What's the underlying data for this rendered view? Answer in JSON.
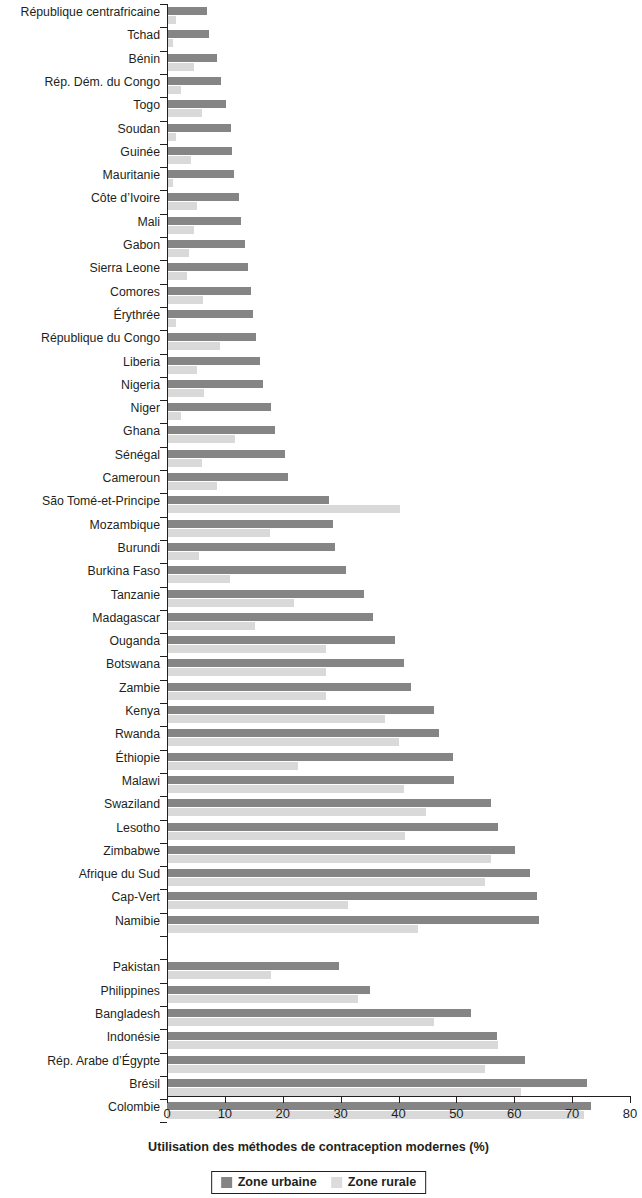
{
  "chart_data": {
    "type": "bar",
    "orientation": "horizontal",
    "title": "",
    "xlabel": "Utilisation des méthodes de contraception modernes (%)",
    "ylabel": "",
    "xlim": [
      0,
      80
    ],
    "xticks": [
      0,
      10,
      20,
      30,
      40,
      50,
      60,
      70,
      80
    ],
    "grid": false,
    "legend_position": "bottom",
    "legend": [
      "Zone urbaine",
      "Zone rurale"
    ],
    "colors": {
      "urban": "#858585",
      "rural": "#d9d9d9",
      "axis": "#231f20",
      "background": "#ffffff"
    },
    "categories": [
      "République centrafricaine",
      "Tchad",
      "Bénin",
      "Rép. Dém. du Congo",
      "Togo",
      "Soudan",
      "Guinée",
      "Mauritanie",
      "Côte d’Ivoire",
      "Mali",
      "Gabon",
      "Sierra Leone",
      "Comores",
      "Érythrée",
      "République du Congo",
      "Liberia",
      "Nigeria",
      "Niger",
      "Ghana",
      "Sénégal",
      "Cameroun",
      "São Tomé-et-Principe",
      "Mozambique",
      "Burundi",
      "Burkina Faso",
      "Tanzanie",
      "Madagascar",
      "Ouganda",
      "Botswana",
      "Zambie",
      "Kenya",
      "Rwanda",
      "Éthiopie",
      "Malawi",
      "Swaziland",
      "Lesotho",
      "Zimbabwe",
      "Afrique du Sud",
      "Cap-Vert",
      "Namibie",
      "Pakistan",
      "Philippines",
      "Bangladesh",
      "Indonésie",
      "Rép. Arabe d’Égypte",
      "Brésil",
      "Colombie"
    ],
    "group_break_after": "Namibie",
    "series": [
      {
        "name": "Zone urbaine",
        "values": [
          6.9,
          7.3,
          8.6,
          9.4,
          10.2,
          11.0,
          11.2,
          11.6,
          12.4,
          12.8,
          13.5,
          14.0,
          14.6,
          14.8,
          15.4,
          16.1,
          16.6,
          18.0,
          18.6,
          20.4,
          20.9,
          28.0,
          28.6,
          29.0,
          31.0,
          34.0,
          35.6,
          39.4,
          41.0,
          42.2,
          46.2,
          47.0,
          49.4,
          49.6,
          56.0,
          57.2,
          60.2,
          62.8,
          64.0,
          64.2,
          29.8,
          35.0,
          52.6,
          57.0,
          61.8,
          72.6,
          73.2
        ]
      },
      {
        "name": "Zone rurale",
        "values": [
          1.6,
          1.0,
          4.6,
          2.4,
          6.0,
          1.6,
          4.2,
          1.0,
          5.2,
          4.6,
          3.8,
          3.4,
          6.2,
          1.6,
          9.2,
          5.2,
          6.4,
          2.4,
          11.8,
          6.0,
          8.6,
          40.2,
          17.8,
          5.6,
          10.8,
          22.0,
          15.2,
          27.4,
          27.4,
          27.4,
          37.6,
          40.0,
          22.6,
          41.0,
          44.8,
          41.2,
          56.0,
          55.0,
          31.2,
          43.4,
          18.0,
          33.0,
          46.2,
          57.2,
          55.0,
          61.2,
          72.0
        ]
      }
    ]
  },
  "axis": {
    "x_title": "Utilisation des méthodes de contraception modernes (%)",
    "tick_labels": [
      "0",
      "10",
      "20",
      "30",
      "40",
      "50",
      "60",
      "70",
      "80"
    ]
  },
  "legend": {
    "urban_label": "Zone urbaine",
    "rural_label": "Zone rurale"
  }
}
